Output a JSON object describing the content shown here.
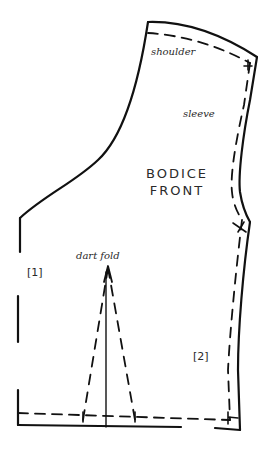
{
  "diagram": {
    "title_line1": "BODICE",
    "title_line2": "FRONT",
    "labels": {
      "shoulder": "shoulder",
      "sleeve": "sleeve",
      "dart_fold": "dart fold",
      "marker_1": "[1]",
      "marker_2": "[2]"
    },
    "colors": {
      "stroke": "#111111",
      "text": "#2a2a2a",
      "background": "#ffffff"
    }
  }
}
